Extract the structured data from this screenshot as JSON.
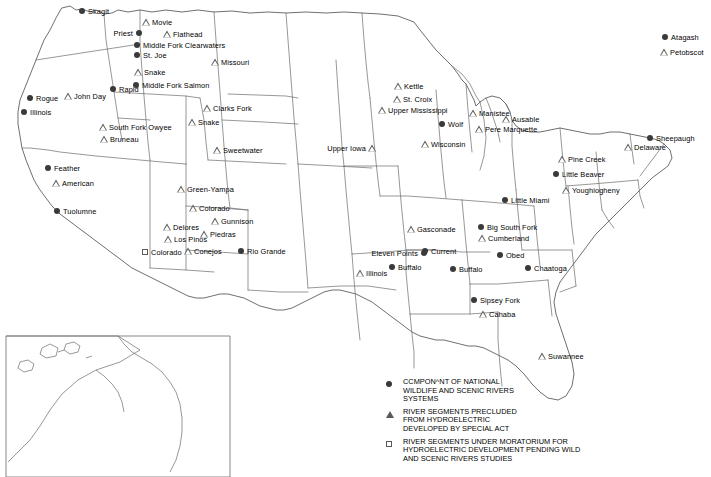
{
  "map": {
    "title": "Nationwide Rivers Inventory map of the United States",
    "legend": [
      {
        "symbol": "dot",
        "text": "CCMPON^NT OF NATIONAL\nWILDLIFE AND SCENIC RIVERS\nSYSTEMS"
      },
      {
        "symbol": "triangle",
        "text": "RIVER SEGMENTS PRECLUDED\nFROM HYDROELECTRIC\nDEVELOPED BY SPECIAL ACT"
      },
      {
        "symbol": "square",
        "text": "RIVER SEGMENTS UNDER MORATORIUM FOR\nHYDROELECTRIC DEVELOPMENT PENDING WILD\nAND SCENIC RIVERS STUDIES"
      }
    ],
    "markers": [
      {
        "label": "Skagit",
        "symbol": "dot",
        "x": 82,
        "y": 11,
        "side": "right"
      },
      {
        "label": "Movie",
        "symbol": "triangle",
        "x": 146,
        "y": 22,
        "side": "right"
      },
      {
        "label": "Priest",
        "symbol": "dot",
        "x": 139,
        "y": 33,
        "side": "left"
      },
      {
        "label": "Flathead",
        "symbol": "triangle",
        "x": 167,
        "y": 34,
        "side": "right"
      },
      {
        "label": "Middle Fork Clearwaters",
        "symbol": "dot",
        "x": 137,
        "y": 45,
        "side": "right"
      },
      {
        "label": "St. Joe",
        "symbol": "dot",
        "x": 137,
        "y": 55,
        "side": "right"
      },
      {
        "label": "Missouri",
        "symbol": "triangle",
        "x": 215,
        "y": 62,
        "side": "right"
      },
      {
        "label": "Snake",
        "symbol": "triangle",
        "x": 138,
        "y": 72,
        "side": "right"
      },
      {
        "label": "Middle Fork Salmon",
        "symbol": "dot",
        "x": 136,
        "y": 85,
        "side": "right"
      },
      {
        "label": "Rapid",
        "symbol": "dot",
        "x": 113,
        "y": 89,
        "side": "right"
      },
      {
        "label": "Kettle",
        "symbol": "triangle",
        "x": 398,
        "y": 86,
        "side": "right"
      },
      {
        "label": "Rogue",
        "symbol": "dot",
        "x": 30,
        "y": 98,
        "side": "right"
      },
      {
        "label": "John Day",
        "symbol": "triangle",
        "x": 68,
        "y": 96,
        "side": "right"
      },
      {
        "label": "St. Croix",
        "symbol": "triangle",
        "x": 397,
        "y": 99,
        "side": "right"
      },
      {
        "label": "Clarks Fork",
        "symbol": "triangle",
        "x": 207,
        "y": 108,
        "side": "right"
      },
      {
        "label": "Manistee",
        "symbol": "triangle",
        "x": 473,
        "y": 113,
        "side": "right"
      },
      {
        "label": "Ausable",
        "symbol": "triangle",
        "x": 506,
        "y": 119,
        "side": "right"
      },
      {
        "label": "Illinois",
        "symbol": "dot",
        "x": 24,
        "y": 112,
        "side": "right"
      },
      {
        "label": "Upper Mississippi",
        "symbol": "triangle",
        "x": 382,
        "y": 110,
        "side": "right"
      },
      {
        "label": "Wolf",
        "symbol": "dot",
        "x": 442,
        "y": 124,
        "side": "right"
      },
      {
        "label": "Pere Marquette",
        "symbol": "triangle",
        "x": 479,
        "y": 129,
        "side": "right"
      },
      {
        "label": "Snake",
        "symbol": "triangle",
        "x": 192,
        "y": 122,
        "side": "right"
      },
      {
        "label": "South Fork Owyee",
        "symbol": "triangle",
        "x": 103,
        "y": 127,
        "side": "right"
      },
      {
        "label": "Bruneau",
        "symbol": "triangle",
        "x": 104,
        "y": 139,
        "side": "right"
      },
      {
        "label": "Wisconsin",
        "symbol": "triangle",
        "x": 425,
        "y": 144,
        "side": "right"
      },
      {
        "label": "Upper Iowa",
        "symbol": "triangle",
        "x": 372,
        "y": 148,
        "side": "left"
      },
      {
        "label": "Sheepaugh",
        "symbol": "dot",
        "x": 650,
        "y": 138,
        "side": "right"
      },
      {
        "label": "Delaware",
        "symbol": "triangle",
        "x": 628,
        "y": 147,
        "side": "right"
      },
      {
        "label": "Sweetwater",
        "symbol": "triangle",
        "x": 217,
        "y": 150,
        "side": "right"
      },
      {
        "label": "Pine Creek",
        "symbol": "triangle",
        "x": 562,
        "y": 159,
        "side": "right"
      },
      {
        "label": "Feather",
        "symbol": "dot",
        "x": 48,
        "y": 168,
        "side": "right"
      },
      {
        "label": "Little Beaver",
        "symbol": "dot",
        "x": 556,
        "y": 174,
        "side": "right"
      },
      {
        "label": "American",
        "symbol": "triangle",
        "x": 56,
        "y": 183,
        "side": "right"
      },
      {
        "label": "Youghiogheny",
        "symbol": "triangle",
        "x": 566,
        "y": 190,
        "side": "right"
      },
      {
        "label": "Green-Yampa",
        "symbol": "triangle",
        "x": 181,
        "y": 189,
        "side": "right"
      },
      {
        "label": "Tuolumne",
        "symbol": "dot",
        "x": 57,
        "y": 211,
        "side": "right"
      },
      {
        "label": "Little Miami",
        "symbol": "dot",
        "x": 505,
        "y": 200,
        "side": "right"
      },
      {
        "label": "Colorado",
        "symbol": "triangle",
        "x": 193,
        "y": 208,
        "side": "right"
      },
      {
        "label": "Gunnison",
        "symbol": "triangle",
        "x": 215,
        "y": 221,
        "side": "right"
      },
      {
        "label": "Gasconade",
        "symbol": "triangle",
        "x": 411,
        "y": 229,
        "side": "right"
      },
      {
        "label": "Big South Fork",
        "symbol": "dot",
        "x": 481,
        "y": 227,
        "side": "right"
      },
      {
        "label": "Delores",
        "symbol": "triangle",
        "x": 167,
        "y": 227,
        "side": "right"
      },
      {
        "label": "Piedras",
        "symbol": "triangle",
        "x": 204,
        "y": 234,
        "side": "right"
      },
      {
        "label": "Cumberland",
        "symbol": "triangle",
        "x": 482,
        "y": 238,
        "side": "right"
      },
      {
        "label": "Los Pinos",
        "symbol": "triangle",
        "x": 168,
        "y": 239,
        "side": "right"
      },
      {
        "label": "Colorado",
        "symbol": "square",
        "x": 145,
        "y": 252,
        "side": "right"
      },
      {
        "label": "Conejos",
        "symbol": "triangle",
        "x": 188,
        "y": 251,
        "side": "right"
      },
      {
        "label": "Rio Grande",
        "symbol": "dot",
        "x": 241,
        "y": 251,
        "side": "right"
      },
      {
        "label": "Eleven Points",
        "symbol": "dot",
        "x": 424,
        "y": 253,
        "side": "left"
      },
      {
        "label": "Current",
        "symbol": "dot",
        "x": 425,
        "y": 251,
        "side": "right"
      },
      {
        "label": "Obed",
        "symbol": "dot",
        "x": 500,
        "y": 255,
        "side": "right"
      },
      {
        "label": "Chaatoga",
        "symbol": "dot",
        "x": 528,
        "y": 268,
        "side": "right"
      },
      {
        "label": "Buffalo",
        "symbol": "dot",
        "x": 392,
        "y": 267,
        "side": "right"
      },
      {
        "label": "Buffalo",
        "symbol": "dot",
        "x": 453,
        "y": 269,
        "side": "right"
      },
      {
        "label": "Illinois",
        "symbol": "triangle",
        "x": 360,
        "y": 273,
        "side": "right"
      },
      {
        "label": "Sipsey Fork",
        "symbol": "dot",
        "x": 474,
        "y": 300,
        "side": "right"
      },
      {
        "label": "Cahaba",
        "symbol": "triangle",
        "x": 483,
        "y": 314,
        "side": "right"
      },
      {
        "label": "Suwannee",
        "symbol": "triangle",
        "x": 542,
        "y": 356,
        "side": "right"
      },
      {
        "label": "Atagash",
        "symbol": "dot",
        "x": 665,
        "y": 37,
        "side": "right"
      },
      {
        "label": "Petobscot",
        "symbol": "triangle",
        "x": 664,
        "y": 52,
        "side": "right"
      }
    ]
  }
}
